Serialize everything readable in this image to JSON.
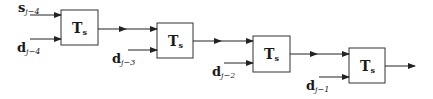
{
  "diagram": {
    "type": "block-chain",
    "blocks": [
      {
        "id": "b1",
        "label": "T",
        "sub": "s",
        "x": 61,
        "y": 10,
        "w": 37,
        "h": 35
      },
      {
        "id": "b2",
        "label": "T",
        "sub": "s",
        "x": 157,
        "y": 23,
        "w": 36,
        "h": 35
      },
      {
        "id": "b3",
        "label": "T",
        "sub": "s",
        "x": 253,
        "y": 36,
        "w": 37,
        "h": 36
      },
      {
        "id": "b4",
        "label": "T",
        "sub": "s",
        "x": 349,
        "y": 48,
        "w": 36,
        "h": 35
      }
    ],
    "inputs": [
      {
        "id": "s_j-4",
        "base": "s",
        "sub": "j−4",
        "target": "b1"
      },
      {
        "id": "d_j-4",
        "base": "d",
        "sub": "j−4",
        "target": "b1"
      },
      {
        "id": "d_j-3",
        "base": "d",
        "sub": "j−3",
        "target": "b2"
      },
      {
        "id": "d_j-2",
        "base": "d",
        "sub": "j−2",
        "target": "b3"
      },
      {
        "id": "d_j-1",
        "base": "d",
        "sub": "j−1",
        "target": "b4"
      }
    ],
    "edges": [
      {
        "from": "b1",
        "to": "b2"
      },
      {
        "from": "b2",
        "to": "b3"
      },
      {
        "from": "b3",
        "to": "b4"
      },
      {
        "from": "b4",
        "to": "output"
      }
    ]
  }
}
